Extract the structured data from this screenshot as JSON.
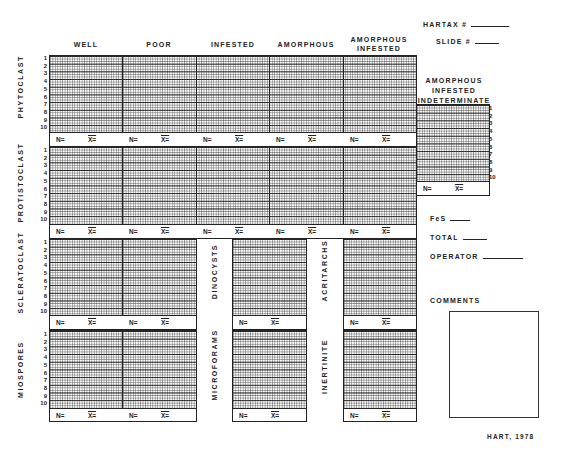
{
  "header": {
    "hartax_label": "HARTAX #",
    "slide_label": "SLIDE #"
  },
  "columns": [
    "WELL",
    "POOR",
    "INFESTED",
    "AMORPHOUS",
    "AMORPHOUS INFESTED"
  ],
  "indeterminate_title": [
    "AMORPHOUS",
    "INFESTED",
    "INDETERMINATE"
  ],
  "row_groups": [
    "PHYTOCLAST",
    "PROTISTOCLAST",
    "SCLERATOCLAST",
    "MIOSPORES"
  ],
  "side_groups": [
    "DINOCYSTS",
    "MICROFORAMS",
    "ACRITARCHS",
    "INERTINITE"
  ],
  "row_numbers": [
    "1",
    "2",
    "3",
    "4",
    "5",
    "6",
    "7",
    "8",
    "9",
    "10"
  ],
  "n_label": "N=",
  "x_label": "X=",
  "fields": {
    "fes": "FeS",
    "total": "TOTAL",
    "operator": "OPERATOR",
    "comments": "COMMENTS"
  },
  "credit": "HART, 1978"
}
